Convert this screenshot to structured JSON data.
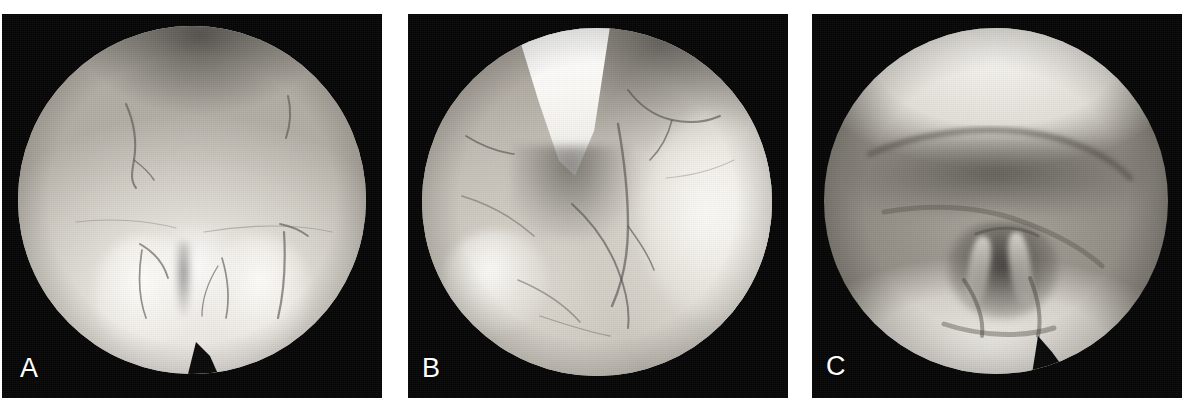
{
  "figure": {
    "type": "endoscopic-image-series",
    "background_color": "#ffffff",
    "panel_background_color": "#070707",
    "label_color": "#ffffff",
    "panel_count": 3,
    "caption": ""
  },
  "panels": [
    {
      "label": "A",
      "name": "panel-a",
      "description": "Circular endoscopic view of pale mucosa with a dark shadowed region at the superior aspect and two bright rounded folds inferiorly separated by a midline crevice; fine branching vessels run across the upper field.",
      "aperture_shape": "circle",
      "dominant_tone": "light-gray",
      "has_instrument": false,
      "has_bottom_notch": true,
      "notch_position": "bottom-center"
    },
    {
      "label": "B",
      "name": "panel-b",
      "description": "Circular endoscopic view with a bright white cone-shaped structure projecting downward from the upper left; mucosal folds curve from lower left to right with a long vertical crease in the mid field and a bright highlight on the right wall.",
      "aperture_shape": "circle",
      "dominant_tone": "mid-gray",
      "has_instrument": true,
      "instrument_name": "white-wedge-structure",
      "instrument_position": "upper-left",
      "has_bottom_notch": false,
      "notch_position": ""
    },
    {
      "label": "C",
      "name": "panel-c",
      "description": "Circular endoscopic view, softer focus, showing a bright superior arch and bright inferior arch framing a darker transverse band, with a dark central cavity containing paired lighter strut-like structures.",
      "aperture_shape": "circle",
      "dominant_tone": "dark-gray",
      "has_instrument": false,
      "has_bottom_notch": true,
      "notch_position": "bottom-right"
    }
  ]
}
